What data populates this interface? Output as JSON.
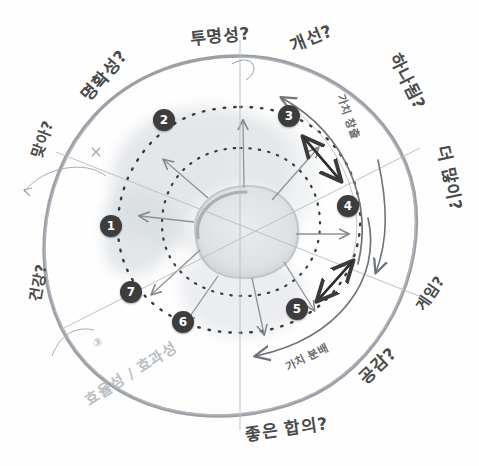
{
  "diagram": {
    "colors": {
      "outer_ring": "#9aa0a6",
      "dashed_ring": "#3a3a3a",
      "node_fill": "#3d3d3d",
      "node_text": "#ffffff",
      "ink": "#4a4a4a",
      "faint_ink": "#b9bec4",
      "smudge": "#dcdfe2",
      "background": "#fefefe"
    },
    "outer_labels": [
      {
        "id": "transparency",
        "text": "투명성?",
        "rotation": -6,
        "x": 190,
        "y": 22
      },
      {
        "id": "improvement",
        "text": "개선?",
        "rotation": -22,
        "x": 289,
        "y": 24
      },
      {
        "id": "clarity",
        "text": "명확성?",
        "rotation": -50,
        "x": 73,
        "y": 62
      },
      {
        "id": "oneness",
        "text": "하나됨?",
        "rotation": 64,
        "x": 379,
        "y": 68
      },
      {
        "id": "correct",
        "text": "맞아?",
        "rotation": -70,
        "x": 22,
        "y": 128
      },
      {
        "id": "more",
        "text": "더 많이?",
        "rotation": 78,
        "x": 425,
        "y": 165
      },
      {
        "id": "genuine",
        "text": "건강?",
        "rotation": -80,
        "x": 22,
        "y": 272
      },
      {
        "id": "game",
        "text": "게임?",
        "rotation": -56,
        "x": 413,
        "y": 280
      },
      {
        "id": "empathy",
        "text": "공감?",
        "rotation": -44,
        "x": 358,
        "y": 352
      },
      {
        "id": "agreement",
        "text": "좋은 합의?",
        "rotation": -8,
        "x": 249,
        "y": 413
      }
    ],
    "inner_labels": [
      {
        "id": "value-creation",
        "text": "가치 창출",
        "rotation": 70,
        "x": 330,
        "y": 108
      },
      {
        "id": "value-distribution",
        "text": "가치 분배",
        "rotation": -26,
        "x": 285,
        "y": 345
      }
    ],
    "faint_labels": [
      {
        "id": "efficiency-effectiveness",
        "text": "효율성 / 효과성",
        "rotation": -32,
        "x": 78,
        "y": 360
      },
      {
        "id": "annotation-mark",
        "text": "③",
        "rotation": -20,
        "x": 93,
        "y": 336
      }
    ],
    "nodes": [
      {
        "id": "node-1",
        "label": "1",
        "x": 111,
        "y": 226
      },
      {
        "id": "node-2",
        "label": "2",
        "x": 164,
        "y": 120
      },
      {
        "id": "node-3",
        "label": "3",
        "x": 289,
        "y": 116
      },
      {
        "id": "node-4",
        "label": "4",
        "x": 348,
        "y": 206
      },
      {
        "id": "node-5",
        "label": "5",
        "x": 297,
        "y": 309
      },
      {
        "id": "node-6",
        "label": "6",
        "x": 183,
        "y": 322
      },
      {
        "id": "node-7",
        "label": "7",
        "x": 131,
        "y": 292
      }
    ],
    "rings": {
      "outer_label": "outer boundary circle",
      "mid_label": "dashed node ring",
      "inner_label": "dashed inner ring",
      "core_label": "central blob core"
    },
    "arrows": {
      "creation_arc_label": "upward value-creation arc",
      "distribution_arc_label": "downward value-distribution arc",
      "radial_label": "radial spoke arrows"
    }
  }
}
